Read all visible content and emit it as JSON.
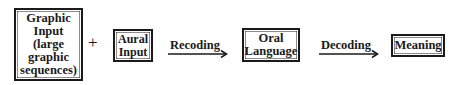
{
  "diagram": {
    "type": "flow",
    "nodes": [
      {
        "id": "graphic_input",
        "lines": [
          "Graphic",
          "Input",
          "(large",
          "graphic",
          "sequences)"
        ]
      },
      {
        "id": "aural_input",
        "lines": [
          "Aural",
          "Input"
        ]
      },
      {
        "id": "oral_language",
        "lines": [
          "Oral",
          "Language"
        ]
      },
      {
        "id": "meaning",
        "lines": [
          "Meaning"
        ]
      }
    ],
    "operators": {
      "plus": "+"
    },
    "edges": [
      {
        "from": "graphic_input+aural_input",
        "to": "oral_language",
        "label": "Recoding"
      },
      {
        "from": "oral_language",
        "to": "meaning",
        "label": "Decoding"
      }
    ],
    "colors": {
      "ink": "#1a1a1a",
      "background": "#ffffff"
    }
  }
}
